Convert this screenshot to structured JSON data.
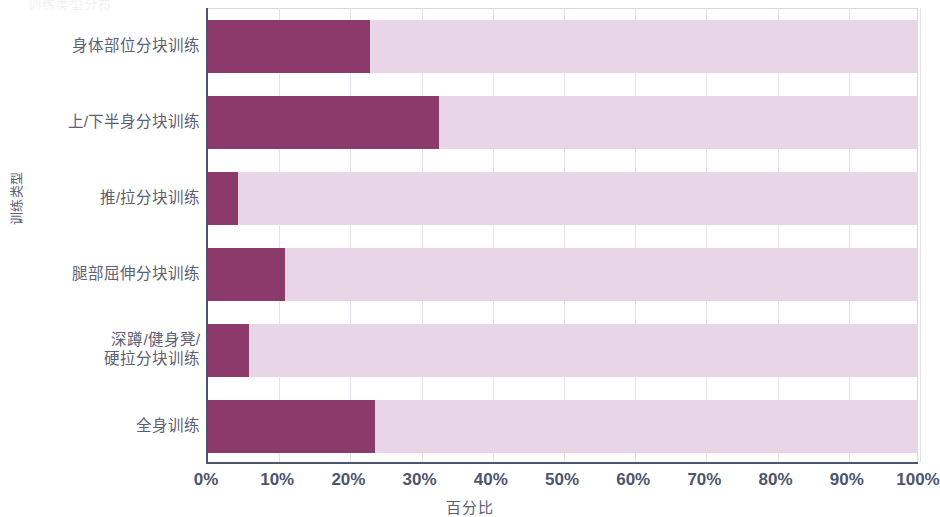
{
  "chart_data": {
    "type": "bar",
    "orientation": "horizontal",
    "stacked": true,
    "title": "训练类型分布",
    "xlabel": "百分比",
    "ylabel": "训练类型",
    "xlim": [
      0,
      100
    ],
    "xticks": [
      "0%",
      "10%",
      "20%",
      "30%",
      "40%",
      "50%",
      "60%",
      "70%",
      "80%",
      "90%",
      "100%"
    ],
    "xtick_values": [
      0,
      10,
      20,
      30,
      40,
      50,
      60,
      70,
      80,
      90,
      100
    ],
    "categories": [
      "身体部位分块训练",
      "上/下半身分块训练",
      "推/拉分块训练",
      "腿部屈伸分块训练",
      "深蹲/健身凳/\n硬拉分块训练",
      "全身训练"
    ],
    "series": [
      {
        "name": "占比",
        "color": "#8b3a6b",
        "values": [
          22.8,
          32.6,
          4.2,
          10.8,
          5.8,
          23.5
        ]
      },
      {
        "name": "剩余",
        "color": "#e8d5e8",
        "values": [
          77.2,
          67.4,
          95.8,
          89.2,
          94.2,
          76.5
        ]
      }
    ],
    "grid": true,
    "grid_axis": "x",
    "legend": false,
    "colors": {
      "bar_fill": "#8b3a6b",
      "bar_remainder": "#e8d5e8",
      "axis": "#4c5470",
      "gridline": "#e2e2e9",
      "text": "#5b6074",
      "background": "#ffffff"
    }
  }
}
